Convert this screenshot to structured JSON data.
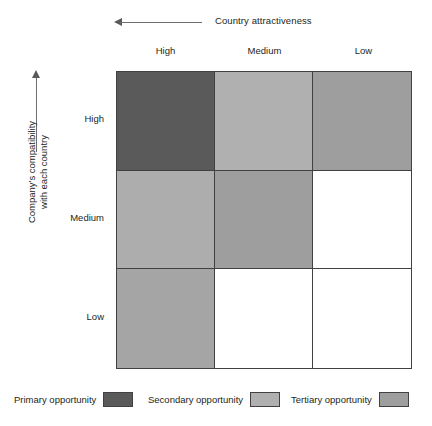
{
  "figure": {
    "x_axis": {
      "caption": "Country attractiveness",
      "arrow_direction": "left",
      "categories": [
        "High",
        "Medium",
        "Low"
      ]
    },
    "y_axis": {
      "caption_line1": "Company's compatibility",
      "caption_line2": "with each country",
      "arrow_direction": "up",
      "categories": [
        "High",
        "Medium",
        "Low"
      ]
    },
    "legend": {
      "items": [
        {
          "label": "Primary opportunity",
          "color": "#5a5a5a"
        },
        {
          "label": "Secondary opportunity",
          "color": "#b0b0b0"
        },
        {
          "label": "Tertiary opportunity",
          "color": "#9e9e9e"
        }
      ]
    }
  },
  "chart_data": {
    "type": "heatmap",
    "title": "",
    "xlabel": "Country attractiveness",
    "ylabel": "Company's compatibility with each country",
    "x_categories": [
      "High",
      "Medium",
      "Low"
    ],
    "y_categories": [
      "High",
      "Medium",
      "Low"
    ],
    "grid": true,
    "legend_position": "bottom",
    "categories_legend": [
      "Primary opportunity",
      "Secondary opportunity",
      "Tertiary opportunity"
    ],
    "cells": [
      [
        {
          "row": "High",
          "col": "High",
          "category": "Primary opportunity",
          "color": "#5a5a5a"
        },
        {
          "row": "High",
          "col": "Medium",
          "category": "Secondary opportunity",
          "color": "#b0b0b0"
        },
        {
          "row": "High",
          "col": "Low",
          "category": "Tertiary opportunity",
          "color": "#9e9e9e"
        }
      ],
      [
        {
          "row": "Medium",
          "col": "High",
          "category": "Secondary opportunity",
          "color": "#adadad"
        },
        {
          "row": "Medium",
          "col": "Medium",
          "category": "Tertiary opportunity",
          "color": "#9e9e9e"
        },
        {
          "row": "Medium",
          "col": "Low",
          "category": "None",
          "color": "#ffffff"
        }
      ],
      [
        {
          "row": "Low",
          "col": "High",
          "category": "Tertiary opportunity",
          "color": "#a5a5a5"
        },
        {
          "row": "Low",
          "col": "Medium",
          "category": "None",
          "color": "#ffffff"
        },
        {
          "row": "Low",
          "col": "Low",
          "category": "None",
          "color": "#ffffff"
        }
      ]
    ]
  }
}
